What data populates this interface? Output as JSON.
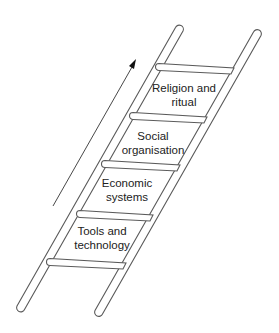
{
  "diagram": {
    "type": "ladder",
    "direction_arrow": "upward",
    "steps": [
      {
        "line1": "Religion and",
        "line2": "ritual",
        "cx": 184,
        "top": 81
      },
      {
        "line1": "Social",
        "line2": "organisation",
        "cx": 153,
        "top": 129
      },
      {
        "line1": "Economic",
        "line2": "systems",
        "cx": 127,
        "top": 176
      },
      {
        "line1": "Tools and",
        "line2": "technology",
        "cx": 102,
        "top": 224
      }
    ]
  },
  "colors": {
    "stroke": "#5a5a5a",
    "text": "#222222",
    "arrow": "#111111",
    "background": "#ffffff"
  }
}
